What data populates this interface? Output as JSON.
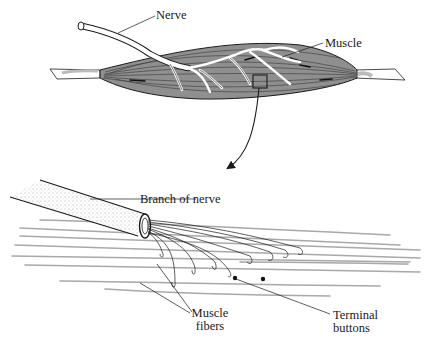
{
  "diagram": {
    "type": "anatomical illustration",
    "top_panel": {
      "labels": {
        "nerve": "Nerve",
        "muscle": "Muscle"
      }
    },
    "bottom_panel": {
      "labels": {
        "branch_of_nerve": "Branch of nerve",
        "muscle_fibers_line1": "Muscle",
        "muscle_fibers_line2": "fibers",
        "terminal_buttons_line1": "Terminal",
        "terminal_buttons_line2": "buttons"
      }
    },
    "colors": {
      "muscle_fill": "#8f8f8f",
      "line": "#1a1a1a",
      "fiber": "#a8a8a8",
      "nerve_fill": "#ffffff"
    }
  }
}
